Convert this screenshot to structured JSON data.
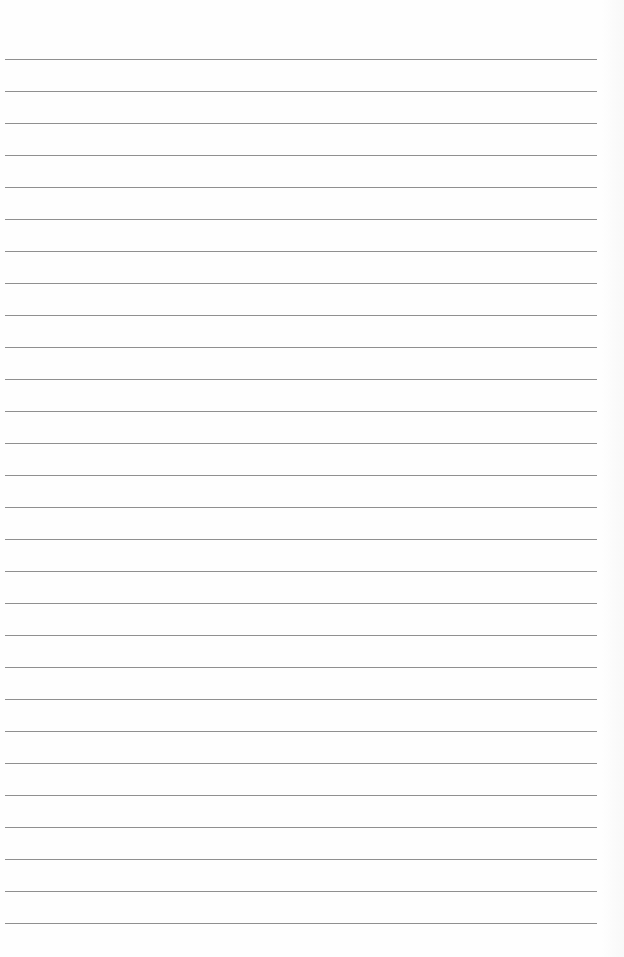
{
  "page": {
    "type": "lined-paper",
    "line_count": 28,
    "first_line_y": 59,
    "line_spacing": 32,
    "line_color": "#8f8f8f",
    "background_color": "#fefefe",
    "text": ""
  }
}
